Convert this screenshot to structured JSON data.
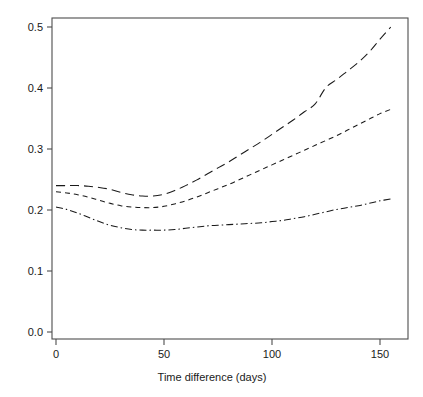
{
  "chart_data": {
    "type": "line",
    "title": "",
    "subtitle": "",
    "xlabel": "Time difference (days)",
    "ylabel": "",
    "xlim": [
      -4,
      163
    ],
    "ylim": [
      -0.012,
      0.512
    ],
    "xticks": [
      0,
      50,
      100,
      150
    ],
    "xticklabels": [
      "0",
      "50",
      "100",
      "150"
    ],
    "yticks": [
      0.0,
      0.1,
      0.2,
      0.3,
      0.4,
      0.5
    ],
    "yticklabels": [
      "0.0",
      "0.1",
      "0.2",
      "0.3",
      "0.4",
      "0.5"
    ],
    "grid": false,
    "legend": "none",
    "line_color": "#1a1a1a",
    "axis_color": "#4d4d4d",
    "background": "#ffffff",
    "x": [
      0,
      5,
      10,
      15,
      20,
      25,
      30,
      35,
      40,
      45,
      50,
      55,
      60,
      65,
      70,
      75,
      80,
      85,
      90,
      95,
      100,
      105,
      110,
      115,
      120,
      125,
      130,
      135,
      140,
      145,
      150,
      155
    ],
    "series": [
      {
        "name": "upper-long-dash",
        "dash": "long-dash",
        "dasharray": "9 5",
        "values": [
          0.24,
          0.24,
          0.24,
          0.239,
          0.237,
          0.234,
          0.229,
          0.225,
          0.223,
          0.223,
          0.226,
          0.232,
          0.24,
          0.249,
          0.259,
          0.269,
          0.279,
          0.29,
          0.301,
          0.312,
          0.324,
          0.336,
          0.348,
          0.361,
          0.374,
          0.401,
          0.414,
          0.428,
          0.442,
          0.459,
          0.48,
          0.5
        ]
      },
      {
        "name": "middle-short-dash",
        "dash": "short-dash",
        "dasharray": "5 4",
        "values": [
          0.23,
          0.228,
          0.225,
          0.221,
          0.216,
          0.211,
          0.207,
          0.205,
          0.204,
          0.204,
          0.206,
          0.21,
          0.215,
          0.221,
          0.228,
          0.235,
          0.242,
          0.25,
          0.258,
          0.266,
          0.274,
          0.282,
          0.29,
          0.298,
          0.306,
          0.314,
          0.322,
          0.331,
          0.34,
          0.349,
          0.358,
          0.365
        ]
      },
      {
        "name": "lower-dash-dot",
        "dash": "dash-dot",
        "dasharray": "7 3 1.5 3",
        "values": [
          0.205,
          0.201,
          0.195,
          0.188,
          0.181,
          0.175,
          0.171,
          0.168,
          0.167,
          0.167,
          0.167,
          0.168,
          0.17,
          0.172,
          0.174,
          0.175,
          0.176,
          0.177,
          0.178,
          0.179,
          0.181,
          0.183,
          0.186,
          0.189,
          0.193,
          0.197,
          0.201,
          0.204,
          0.207,
          0.211,
          0.215,
          0.218
        ]
      }
    ],
    "annotations": []
  }
}
